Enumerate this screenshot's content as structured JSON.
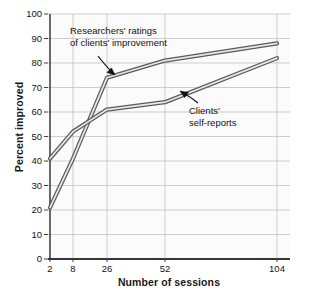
{
  "chart_data": {
    "type": "line",
    "title": "",
    "xlabel": "Number of sessions",
    "ylabel": "Percent improved",
    "x": [
      2,
      8,
      26,
      52,
      104
    ],
    "xtick_labels": [
      "2",
      "8",
      "26",
      "52",
      "104"
    ],
    "ytick_labels": [
      "0",
      "10",
      "20",
      "30",
      "40",
      "50",
      "60",
      "70",
      "80",
      "90",
      "100"
    ],
    "ylim": [
      0,
      100
    ],
    "ystep": 10,
    "grid": true,
    "legend": "none",
    "series": [
      {
        "name": "Researchers' ratings of clients' improvement",
        "values": [
          21,
          41,
          74,
          81,
          88
        ]
      },
      {
        "name": "Clients' self-reports",
        "values": [
          41,
          52,
          61,
          64,
          82
        ]
      }
    ],
    "annotations": [
      {
        "name": "researchers-label",
        "line1": "Researchers' ratings",
        "line2": "of clients' improvement",
        "points_to": "researchers-line"
      },
      {
        "name": "clients-label",
        "line1": "Clients'",
        "line2": "self-reports",
        "points_to": "clients-line"
      }
    ],
    "colors": {
      "line_stroke": "#5a5a5a",
      "line_fill": "#e8e8e8",
      "grid": "#b9b9b9",
      "axis": "#2b2b2b",
      "plot_background": "#fbfbfb",
      "text": "#141414"
    }
  }
}
